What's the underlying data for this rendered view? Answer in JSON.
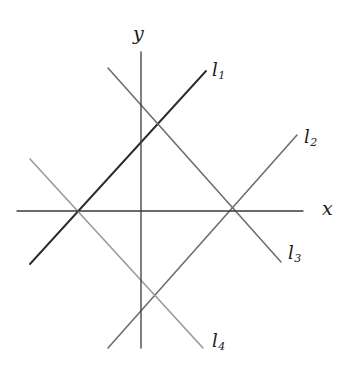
{
  "figure": {
    "kind": "coordinate-plane-line-diagram",
    "background_color": "#ffffff",
    "width": 353,
    "height": 386
  },
  "axes": {
    "x": {
      "label": "x",
      "color": "#3a3a3a",
      "stroke_width": 1.3,
      "x1": 17,
      "y1": 211,
      "x2": 303,
      "y2": 211
    },
    "y": {
      "label": "y",
      "color": "#3a3a3a",
      "stroke_width": 1.3,
      "x1": 141,
      "y1": 52,
      "x2": 141,
      "y2": 348
    },
    "origin": {
      "x": 141,
      "y": 211
    }
  },
  "lines": [
    {
      "id": "l1",
      "label": "l",
      "subscript": "1",
      "color": "#2b2b2b",
      "stroke_width": 1.9,
      "slope_sign": "positive",
      "x1": 30,
      "y1": 264,
      "x2": 206,
      "y2": 71,
      "x_intercept": {
        "x": 77,
        "y": 211
      }
    },
    {
      "id": "l2",
      "label": "l",
      "subscript": "2",
      "color": "#6e6e6e",
      "stroke_width": 1.6,
      "slope_sign": "positive",
      "x1": 108,
      "y1": 348,
      "x2": 297,
      "y2": 135,
      "x_intercept": {
        "x": 235,
        "y": 211
      }
    },
    {
      "id": "l3",
      "label": "l",
      "subscript": "3",
      "color": "#6e6e6e",
      "stroke_width": 1.6,
      "slope_sign": "negative",
      "x1": 108,
      "y1": 68,
      "x2": 281,
      "y2": 262,
      "x_intercept": {
        "x": 235,
        "y": 211
      }
    },
    {
      "id": "l4",
      "label": "l",
      "subscript": "4",
      "color": "#9a9a9a",
      "stroke_width": 1.6,
      "slope_sign": "negative",
      "x1": 30,
      "y1": 159,
      "x2": 203,
      "y2": 348,
      "x_intercept": {
        "x": 77,
        "y": 211
      }
    }
  ],
  "intersections": [
    {
      "name": "left-x-axis-node",
      "x": 77,
      "y": 211,
      "lines": [
        "l1",
        "l4"
      ]
    },
    {
      "name": "right-x-axis-node",
      "x": 235,
      "y": 211,
      "lines": [
        "l2",
        "l3"
      ]
    },
    {
      "name": "upper-node",
      "x": 156,
      "y": 124,
      "lines": [
        "l1",
        "l3"
      ]
    },
    {
      "name": "lower-node",
      "x": 156,
      "y": 296,
      "lines": [
        "l2",
        "l4"
      ]
    }
  ]
}
